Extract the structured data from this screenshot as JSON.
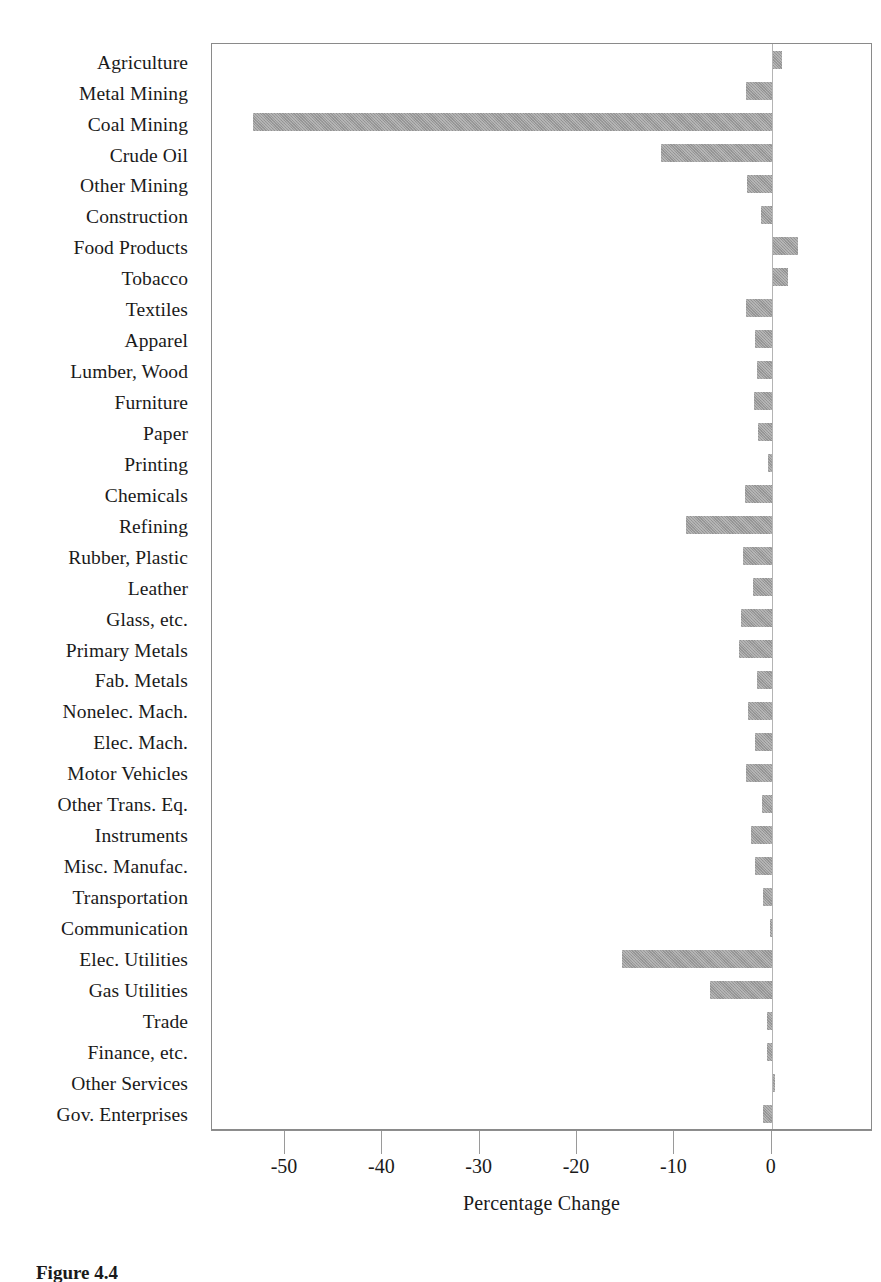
{
  "figure": {
    "caption": "Figure 4.4"
  },
  "chart_data": {
    "type": "bar",
    "orientation": "horizontal",
    "title": "",
    "subtitle": "",
    "xlabel": "Percentage Change",
    "ylabel": "",
    "xlim": [
      -57.5,
      10.4
    ],
    "xticks": [
      -50,
      -40,
      -30,
      -20,
      -10,
      0
    ],
    "xtick_labels": [
      "-50",
      "-40",
      "-30",
      "-20",
      "-10",
      "0"
    ],
    "grid": false,
    "legend": null,
    "bar_color": "#9b9b9b",
    "zero_line_color": "#b4b4b4",
    "frame_color": "#8a8a8a",
    "categories": [
      "Agriculture",
      "Metal Mining",
      "Coal Mining",
      "Crude Oil",
      "Other Mining",
      "Construction",
      "Food Products",
      "Tobacco",
      "Textiles",
      "Apparel",
      "Lumber, Wood",
      "Furniture",
      "Paper",
      "Printing",
      "Chemicals",
      "Refining",
      "Rubber, Plastic",
      "Leather",
      "Glass, etc.",
      "Primary Metals",
      "Fab. Metals",
      "Nonelec. Mach.",
      "Elec. Mach.",
      "Motor Vehicles",
      "Other Trans. Eq.",
      "Instruments",
      "Misc. Manufac.",
      "Transportation",
      "Communication",
      "Elec. Utilities",
      "Gas Utilities",
      "Trade",
      "Finance, etc.",
      "Other Services",
      "Gov. Enterprises"
    ],
    "values": [
      1.1,
      -2.6,
      -53.3,
      -11.4,
      -2.5,
      -1.1,
      2.7,
      1.7,
      -2.6,
      -1.7,
      -1.5,
      -1.8,
      -1.4,
      -0.4,
      -2.7,
      -8.8,
      -3.0,
      -1.9,
      -3.2,
      -3.4,
      -1.5,
      -2.4,
      -1.7,
      -2.6,
      -1.0,
      -2.1,
      -1.7,
      -0.9,
      -0.2,
      -15.4,
      -6.3,
      -0.5,
      -0.5,
      0.3,
      -0.9
    ]
  }
}
